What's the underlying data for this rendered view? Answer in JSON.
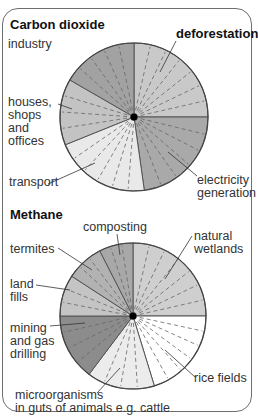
{
  "carbon_dioxide": {
    "title": "Carbon dioxide",
    "labels": {
      "industry": "industry",
      "deforestation": "deforestation",
      "houses": "houses,\nshops\nand\noffices",
      "transport": "transport",
      "electricity": "electricity\ngeneration"
    }
  },
  "methane": {
    "title": "Methane",
    "labels": {
      "composting": "composting",
      "natural_wetlands": "natural\nwetlands",
      "termites": "termites",
      "land_fills": "land\nfills",
      "mining": "mining\nand gas\ndrilling",
      "rice_fields": "rice fields",
      "microorganisms": "microorganisms\nin guts of animals e.g. cattle"
    }
  },
  "chart_data": [
    {
      "type": "pie",
      "title": "Carbon dioxide",
      "categories": [
        "deforestation",
        "electricity generation",
        "transport",
        "houses, shops and offices",
        "industry"
      ],
      "start_angles_deg": [
        0,
        90,
        172,
        248,
        300
      ],
      "end_angles_deg": [
        90,
        172,
        248,
        300,
        360
      ],
      "colors": [
        "#c9c9c9",
        "#a9a9a9",
        "#e9e9e9",
        "#c3c3c3",
        "#a2a2a2"
      ],
      "center": [
        134,
        117
      ],
      "radius": 74
    },
    {
      "type": "pie",
      "title": "Methane",
      "categories": [
        "natural wetlands",
        "rice fields",
        "microorganisms in guts of animals e.g. cattle",
        "mining and gas drilling",
        "land fills",
        "termites",
        "composting"
      ],
      "start_angles_deg": [
        0,
        90,
        163,
        217,
        270,
        303,
        333
      ],
      "end_angles_deg": [
        90,
        163,
        217,
        270,
        303,
        333,
        360
      ],
      "colors": [
        "#cfcfcf",
        "#ffffff",
        "#ececec",
        "#8c8c8c",
        "#c4c4c4",
        "#b2b2b2",
        "#a8a8a8"
      ],
      "center": [
        133,
        316
      ],
      "radius": 73
    }
  ]
}
